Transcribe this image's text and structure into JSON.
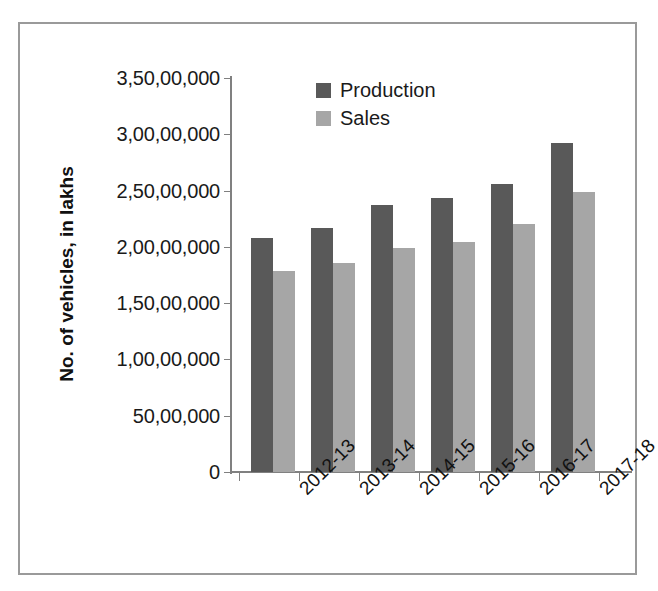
{
  "chart_data": {
    "type": "bar",
    "title": "",
    "xlabel": "",
    "ylabel": "No. of vehicles, in lakhs",
    "categories": [
      "2012-13",
      "2013-14",
      "2014-15",
      "2015-16",
      "2016-17",
      "2017-18"
    ],
    "series": [
      {
        "name": "Production",
        "color": "#595959",
        "values": [
          20800000,
          21700000,
          23700000,
          24300000,
          25600000,
          29200000
        ]
      },
      {
        "name": "Sales",
        "color": "#a6a6a6",
        "values": [
          17900000,
          18600000,
          19900000,
          20400000,
          22000000,
          24900000
        ]
      }
    ],
    "ylim": [
      0,
      35000000
    ],
    "ytick_values": [
      0,
      5000000,
      10000000,
      15000000,
      20000000,
      25000000,
      30000000,
      35000000
    ],
    "ytick_labels": [
      "0",
      "50,00,000",
      "1,00,00,000",
      "1,50,00,000",
      "2,00,00,000",
      "2,50,00,000",
      "3,00,00,000",
      "3,50,00,000"
    ],
    "grid": false,
    "legend_position": "top-center"
  },
  "legend": {
    "items": [
      {
        "label": "Production",
        "color": "#595959"
      },
      {
        "label": "Sales",
        "color": "#a6a6a6"
      }
    ]
  }
}
